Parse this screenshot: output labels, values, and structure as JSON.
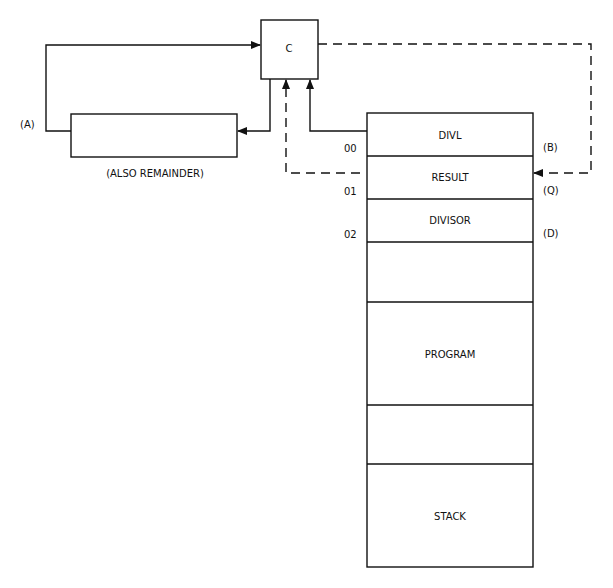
{
  "diagram": {
    "controller": {
      "label": "C"
    },
    "accumulator": {
      "label": "(A)",
      "caption": "(ALSO REMAINDER)"
    },
    "memory": {
      "cells": [
        {
          "name": "DIVL",
          "address": "00",
          "register": "(B)"
        },
        {
          "name": "RESULT",
          "address": "01",
          "register": "(Q)"
        },
        {
          "name": "DIVISOR",
          "address": "02",
          "register": "(D)"
        },
        {
          "name": ""
        },
        {
          "name": "PROGRAM"
        },
        {
          "name": ""
        },
        {
          "name": "STACK"
        }
      ]
    }
  }
}
